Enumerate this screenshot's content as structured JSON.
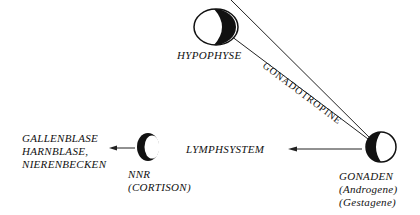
{
  "nodes": {
    "hypophyse": {
      "label": "HYPOPHYSE"
    },
    "gonaden": {
      "label": "GONADEN",
      "sub1": "(Androgene)",
      "sub2": "(Gestagene)"
    },
    "nnr": {
      "label": "NNR",
      "sub1": "(CORTISON)"
    },
    "targets": {
      "line1": "GALLENBLASE",
      "line2": "HARNBLASE,",
      "line3": "NIERENBECKEN"
    },
    "lymph": {
      "label": "LYMPHSYSTEM"
    }
  },
  "edges": {
    "gonadotropine": {
      "label": "GONADOTROPINE"
    }
  }
}
